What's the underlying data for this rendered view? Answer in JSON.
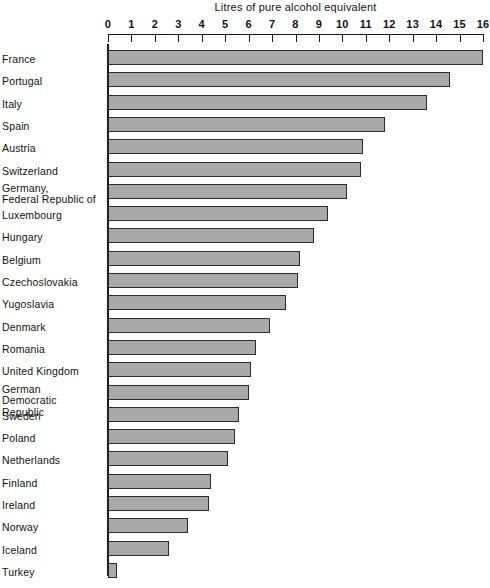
{
  "chart_data": {
    "type": "bar",
    "orientation": "horizontal",
    "title": "Litres of pure alcohol equivalent",
    "xlabel": "Litres of pure alcohol equivalent",
    "ylabel": "",
    "xlim": [
      0,
      16
    ],
    "grid": false,
    "legend": null,
    "tick_labels": [
      "0",
      "1",
      "2",
      "3",
      "4",
      "5",
      "6",
      "7",
      "8",
      "9",
      "10",
      "11",
      "12",
      "13",
      "14",
      "15",
      "16"
    ],
    "tick_values": [
      0,
      1,
      2,
      3,
      4,
      5,
      6,
      7,
      8,
      9,
      10,
      11,
      12,
      13,
      14,
      15,
      16
    ],
    "categories": [
      "France",
      "Portugal",
      "Italy",
      "Spain",
      "Austria",
      "Switzerland",
      "Germany,\nFederal Republic of",
      "Luxembourg",
      "Hungary",
      "Belgium",
      "Czechoslovakia",
      "Yugoslavia",
      "Denmark",
      "Romania",
      "United Kingdom",
      "German Democratic\nRepublic",
      "Sweden",
      "Poland",
      "Netherlands",
      "Finland",
      "Ireland",
      "Norway",
      "Iceland",
      "Turkey"
    ],
    "values": [
      16.0,
      14.6,
      13.6,
      11.8,
      10.9,
      10.8,
      10.2,
      9.4,
      8.8,
      8.2,
      8.1,
      7.6,
      6.9,
      6.3,
      6.1,
      6.0,
      5.6,
      5.4,
      5.1,
      4.4,
      4.3,
      3.4,
      2.6,
      0.4
    ],
    "bar_color": "#a9a9a9",
    "bar_border_color": "#2b2b2b",
    "axis_color": "#1a1a1a",
    "background": "#ffffff"
  },
  "rows": [
    {
      "label": "France",
      "label_line1": "France",
      "label_line2": "",
      "value": 16.0,
      "lines": 1
    },
    {
      "label": "Portugal",
      "label_line1": "Portugal",
      "label_line2": "",
      "value": 14.6,
      "lines": 1
    },
    {
      "label": "Italy",
      "label_line1": "Italy",
      "label_line2": "",
      "value": 13.6,
      "lines": 1
    },
    {
      "label": "Spain",
      "label_line1": "Spain",
      "label_line2": "",
      "value": 11.8,
      "lines": 1
    },
    {
      "label": "Austria",
      "label_line1": "Austria",
      "label_line2": "",
      "value": 10.9,
      "lines": 1
    },
    {
      "label": "Switzerland",
      "label_line1": "Switzerland",
      "label_line2": "",
      "value": 10.8,
      "lines": 1
    },
    {
      "label": "Germany, Federal Republic of",
      "label_line1": "Germany,",
      "label_line2": "Federal Republic of",
      "value": 10.2,
      "lines": 2
    },
    {
      "label": "Luxembourg",
      "label_line1": "Luxembourg",
      "label_line2": "",
      "value": 9.4,
      "lines": 1
    },
    {
      "label": "Hungary",
      "label_line1": "Hungary",
      "label_line2": "",
      "value": 8.8,
      "lines": 1
    },
    {
      "label": "Belgium",
      "label_line1": "Belgium",
      "label_line2": "",
      "value": 8.2,
      "lines": 1
    },
    {
      "label": "Czechoslovakia",
      "label_line1": "Czechoslovakia",
      "label_line2": "",
      "value": 8.1,
      "lines": 1
    },
    {
      "label": "Yugoslavia",
      "label_line1": "Yugoslavia",
      "label_line2": "",
      "value": 7.6,
      "lines": 1
    },
    {
      "label": "Denmark",
      "label_line1": "Denmark",
      "label_line2": "",
      "value": 6.9,
      "lines": 1
    },
    {
      "label": "Romania",
      "label_line1": "Romania",
      "label_line2": "",
      "value": 6.3,
      "lines": 1
    },
    {
      "label": "United Kingdom",
      "label_line1": "United Kingdom",
      "label_line2": "",
      "value": 6.1,
      "lines": 1
    },
    {
      "label": "German Democratic Republic",
      "label_line1": "German Democratic",
      "label_line2": "Republic",
      "value": 6.0,
      "lines": 2
    },
    {
      "label": "Sweden",
      "label_line1": "Sweden",
      "label_line2": "",
      "value": 5.6,
      "lines": 1
    },
    {
      "label": "Poland",
      "label_line1": "Poland",
      "label_line2": "",
      "value": 5.4,
      "lines": 1
    },
    {
      "label": "Netherlands",
      "label_line1": "Netherlands",
      "label_line2": "",
      "value": 5.1,
      "lines": 1
    },
    {
      "label": "Finland",
      "label_line1": "Finland",
      "label_line2": "",
      "value": 4.4,
      "lines": 1
    },
    {
      "label": "Ireland",
      "label_line1": "Ireland",
      "label_line2": "",
      "value": 4.3,
      "lines": 1
    },
    {
      "label": "Norway",
      "label_line1": "Norway",
      "label_line2": "",
      "value": 3.4,
      "lines": 1
    },
    {
      "label": "Iceland",
      "label_line1": "Iceland",
      "label_line2": "",
      "value": 2.6,
      "lines": 1
    },
    {
      "label": "Turkey",
      "label_line1": "Turkey",
      "label_line2": "",
      "value": 0.4,
      "lines": 1
    }
  ]
}
